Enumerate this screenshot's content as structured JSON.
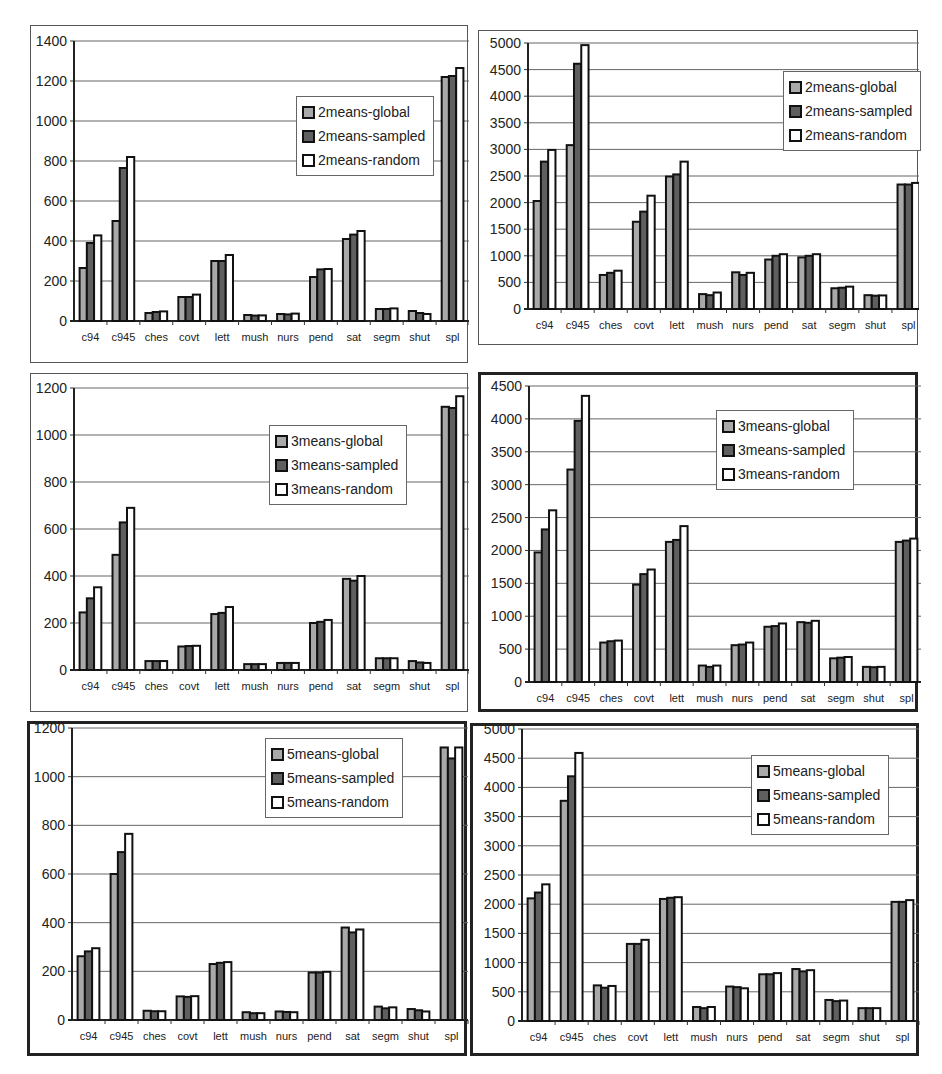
{
  "colors": {
    "global": "#a9a9a9",
    "sampled": "#5f5f5f",
    "random": "#ffffff",
    "bar_outline": "#111111",
    "gridline": "#666666"
  },
  "chart_data": [
    {
      "id": "chart-2means-small",
      "type": "bar",
      "title": "",
      "xlabel": "",
      "ylabel": "",
      "categories": [
        "c94",
        "c945",
        "ches",
        "covt",
        "lett",
        "mush",
        "nurs",
        "pend",
        "sat",
        "segm",
        "shut",
        "spl"
      ],
      "ylim": [
        0,
        1400
      ],
      "yticks": [
        "0",
        "200",
        "400",
        "600",
        "800",
        "1000",
        "1200",
        "1400"
      ],
      "grid": true,
      "legend_position": "upper-center-right",
      "series": [
        {
          "name": "2means-global",
          "values": [
            265,
            500,
            40,
            120,
            300,
            30,
            35,
            220,
            410,
            60,
            50,
            1220
          ]
        },
        {
          "name": "2means-sampled",
          "values": [
            390,
            765,
            45,
            120,
            300,
            27,
            33,
            258,
            432,
            60,
            40,
            1225
          ]
        },
        {
          "name": "2means-random",
          "values": [
            428,
            820,
            48,
            132,
            330,
            28,
            37,
            260,
            450,
            63,
            35,
            1265
          ]
        }
      ]
    },
    {
      "id": "chart-2means-large",
      "type": "bar",
      "title": "",
      "xlabel": "",
      "ylabel": "",
      "categories": [
        "c94",
        "c945",
        "ches",
        "covt",
        "lett",
        "mush",
        "nurs",
        "pend",
        "sat",
        "segm",
        "shut",
        "spl"
      ],
      "ylim": [
        0,
        5000
      ],
      "yticks": [
        "0",
        "500",
        "1000",
        "1500",
        "2000",
        "2500",
        "3000",
        "3500",
        "4000",
        "4500",
        "5000"
      ],
      "grid": true,
      "legend_position": "upper-right",
      "series": [
        {
          "name": "2means-global",
          "values": [
            2030,
            3080,
            640,
            1640,
            2490,
            280,
            690,
            930,
            970,
            390,
            260,
            2340
          ]
        },
        {
          "name": "2means-sampled",
          "values": [
            2770,
            4610,
            680,
            1830,
            2530,
            260,
            640,
            1000,
            1000,
            400,
            250,
            2340
          ]
        },
        {
          "name": "2means-random",
          "values": [
            2990,
            4960,
            720,
            2130,
            2770,
            310,
            680,
            1030,
            1030,
            420,
            255,
            2370
          ]
        }
      ]
    },
    {
      "id": "chart-3means-small",
      "type": "bar",
      "title": "",
      "xlabel": "",
      "ylabel": "",
      "categories": [
        "c94",
        "c945",
        "ches",
        "covt",
        "lett",
        "mush",
        "nurs",
        "pend",
        "sat",
        "segm",
        "shut",
        "spl"
      ],
      "ylim": [
        0,
        1200
      ],
      "yticks": [
        "0",
        "200",
        "400",
        "600",
        "800",
        "1000",
        "1200"
      ],
      "grid": true,
      "legend_position": "upper-center-right",
      "series": [
        {
          "name": "3means-global",
          "values": [
            245,
            490,
            38,
            100,
            238,
            25,
            30,
            200,
            388,
            50,
            38,
            1120
          ]
        },
        {
          "name": "3means-sampled",
          "values": [
            305,
            628,
            38,
            102,
            243,
            25,
            30,
            205,
            380,
            50,
            32,
            1115
          ]
        },
        {
          "name": "3means-random",
          "values": [
            352,
            690,
            38,
            103,
            268,
            25,
            30,
            213,
            400,
            50,
            30,
            1165
          ]
        }
      ]
    },
    {
      "id": "chart-3means-large",
      "type": "bar",
      "title": "",
      "xlabel": "",
      "ylabel": "",
      "categories": [
        "c94",
        "c945",
        "ches",
        "covt",
        "lett",
        "mush",
        "nurs",
        "pend",
        "sat",
        "segm",
        "shut",
        "spl"
      ],
      "ylim": [
        0,
        4500
      ],
      "yticks": [
        "0",
        "500",
        "1000",
        "1500",
        "2000",
        "2500",
        "3000",
        "3500",
        "4000",
        "4500"
      ],
      "grid": true,
      "legend_position": "upper-center",
      "series": [
        {
          "name": "3means-global",
          "values": [
            1970,
            3230,
            600,
            1480,
            2130,
            250,
            560,
            840,
            910,
            360,
            230,
            2130
          ]
        },
        {
          "name": "3means-sampled",
          "values": [
            2320,
            3970,
            620,
            1640,
            2160,
            230,
            570,
            850,
            900,
            370,
            225,
            2150
          ]
        },
        {
          "name": "3means-random",
          "values": [
            2610,
            4350,
            630,
            1710,
            2370,
            250,
            600,
            890,
            930,
            380,
            230,
            2180
          ]
        }
      ]
    },
    {
      "id": "chart-5means-small",
      "type": "bar",
      "title": "",
      "xlabel": "",
      "ylabel": "",
      "categories": [
        "c94",
        "c945",
        "ches",
        "covt",
        "lett",
        "mush",
        "nurs",
        "pend",
        "sat",
        "segm",
        "shut",
        "spl"
      ],
      "ylim": [
        0,
        1200
      ],
      "yticks": [
        "0",
        "200",
        "400",
        "600",
        "800",
        "1000",
        "1200"
      ],
      "grid": true,
      "legend_position": "upper-center-right",
      "series": [
        {
          "name": "5means-global",
          "values": [
            262,
            600,
            38,
            97,
            230,
            32,
            35,
            195,
            380,
            55,
            45,
            1120
          ]
        },
        {
          "name": "5means-sampled",
          "values": [
            282,
            690,
            36,
            95,
            235,
            28,
            33,
            195,
            360,
            48,
            40,
            1075
          ]
        },
        {
          "name": "5means-random",
          "values": [
            295,
            765,
            36,
            98,
            238,
            28,
            32,
            198,
            372,
            52,
            35,
            1120
          ]
        }
      ]
    },
    {
      "id": "chart-5means-large",
      "type": "bar",
      "title": "",
      "xlabel": "",
      "ylabel": "",
      "categories": [
        "c94",
        "c945",
        "ches",
        "covt",
        "lett",
        "mush",
        "nurs",
        "pend",
        "sat",
        "segm",
        "shut",
        "spl"
      ],
      "ylim": [
        0,
        5000
      ],
      "yticks": [
        "0",
        "500",
        "1000",
        "1500",
        "2000",
        "2500",
        "3000",
        "3500",
        "4000",
        "4500",
        "5000"
      ],
      "grid": true,
      "legend_position": "upper-right",
      "series": [
        {
          "name": "5means-global",
          "values": [
            2100,
            3770,
            610,
            1320,
            2090,
            240,
            590,
            800,
            890,
            360,
            220,
            2040
          ]
        },
        {
          "name": "5means-sampled",
          "values": [
            2200,
            4190,
            570,
            1320,
            2110,
            220,
            580,
            800,
            850,
            340,
            220,
            2040
          ]
        },
        {
          "name": "5means-random",
          "values": [
            2340,
            4590,
            600,
            1390,
            2120,
            240,
            560,
            820,
            870,
            350,
            220,
            2070
          ]
        }
      ]
    }
  ],
  "layout": [
    {
      "frame": [
        30,
        25,
        438,
        338
      ],
      "border": "thin",
      "plot": [
        43,
        15,
        395,
        280
      ],
      "legend": [
        222,
        55
      ]
    },
    {
      "frame": [
        478,
        30,
        440,
        315
      ],
      "border": "thin",
      "plot": [
        49,
        12,
        397,
        266
      ],
      "legend": [
        255,
        28
      ]
    },
    {
      "frame": [
        30,
        373,
        438,
        339
      ],
      "border": "thin",
      "plot": [
        43,
        14,
        395,
        282
      ],
      "legend": [
        195,
        37
      ]
    },
    {
      "frame": [
        478,
        372,
        440,
        340
      ],
      "border": "thick",
      "plot": [
        48,
        11,
        394,
        296
      ],
      "legend": [
        187,
        24
      ]
    },
    {
      "frame": [
        27,
        721,
        440,
        335
      ],
      "border": "thick",
      "plot": [
        42,
        4,
        396,
        292
      ],
      "legend": [
        193,
        10
      ]
    },
    {
      "frame": [
        470,
        723,
        449,
        333
      ],
      "border": "thick",
      "plot": [
        49,
        3,
        397,
        292
      ],
      "legend": [
        229,
        26
      ]
    }
  ]
}
